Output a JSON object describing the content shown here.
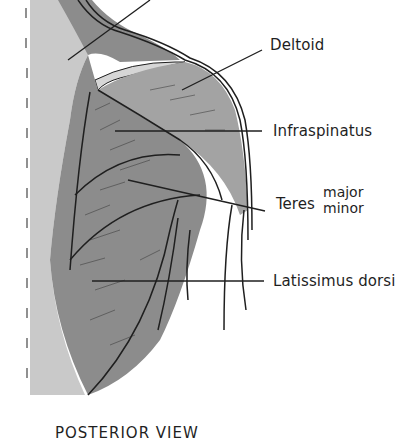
{
  "diagram": {
    "view_caption": "POSTERIOR VIEW",
    "labels": {
      "deltoid": "Deltoid",
      "infraspinatus": "Infraspinatus",
      "teres_main": "Teres",
      "teres_major": "major",
      "teres_minor": "minor",
      "latissimus_dorsi": "Latissimus dorsi"
    },
    "colors": {
      "muscle_dark": "#8c8c8c",
      "muscle_mid": "#a3a3a3",
      "skin_light": "#c9c9c9",
      "background": "#ffffff",
      "line": "#1f1f1f"
    }
  }
}
